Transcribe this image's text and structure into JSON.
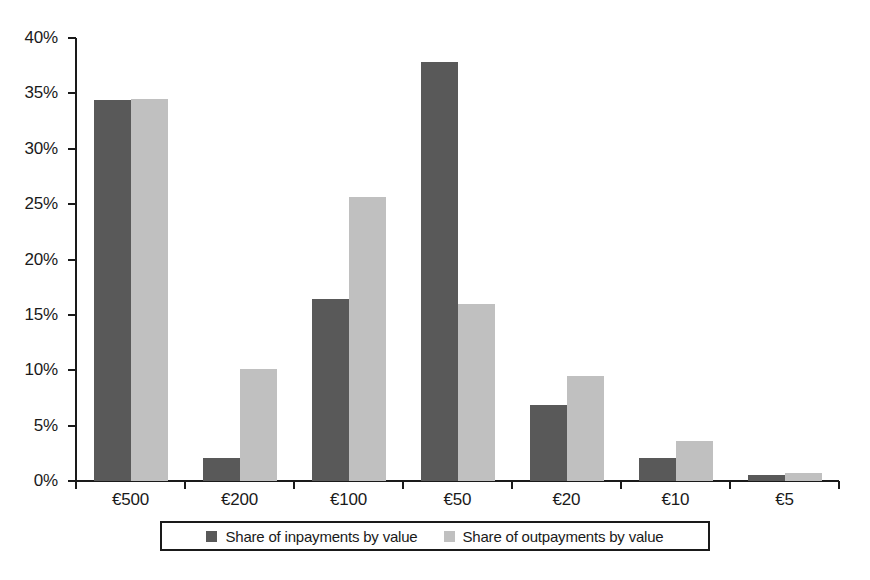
{
  "chart_data": {
    "type": "bar",
    "title": "",
    "subtitle": "",
    "xlabel": "",
    "ylabel": "",
    "categories": [
      "€500",
      "€200",
      "€100",
      "€50",
      "€20",
      "€10",
      "€5"
    ],
    "series": [
      {
        "name": "Share of inpayments by value",
        "color": "#595959",
        "values": [
          34.4,
          2.1,
          16.4,
          37.8,
          6.9,
          2.1,
          0.5
        ]
      },
      {
        "name": "Share of outpayments by value",
        "color": "#c0c0c0",
        "values": [
          34.5,
          10.1,
          25.6,
          16.0,
          9.5,
          3.6,
          0.7
        ]
      }
    ],
    "ylim": [
      0,
      40
    ],
    "ytick_values": [
      0,
      5,
      10,
      15,
      20,
      25,
      30,
      35,
      40
    ],
    "ytick_labels": [
      "0%",
      "5%",
      "10%",
      "15%",
      "20%",
      "25%",
      "30%",
      "35%",
      "40%"
    ],
    "value_suffix": "%",
    "grid": false,
    "legend_position": "bottom",
    "orientation": "vertical",
    "bar_group_mode": "grouped"
  },
  "legend": {
    "entries": [
      {
        "label": "Share of inpayments by value",
        "color": "#595959"
      },
      {
        "label": "Share of outpayments by value",
        "color": "#c0c0c0"
      }
    ]
  },
  "colors": {
    "axis": "#1a1a1a",
    "background": "#ffffff",
    "series_dark": "#595959",
    "series_light": "#c0c0c0"
  }
}
